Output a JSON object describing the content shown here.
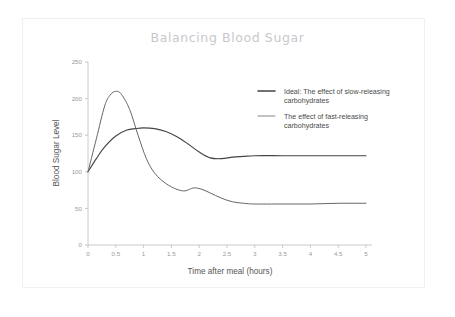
{
  "chart_data": {
    "type": "line",
    "title": "Balancing Blood Sugar",
    "xlabel": "Time after meal (hours)",
    "ylabel": "Blood Sugar Level",
    "xlim": [
      0,
      5
    ],
    "ylim": [
      0,
      250
    ],
    "xticks": [
      "0",
      "0.5",
      "1",
      "1.5",
      "2",
      "2.5",
      "3",
      "3.5",
      "4",
      "4.5",
      "5"
    ],
    "yticks": [
      "0",
      "50",
      "100",
      "150",
      "200",
      "250"
    ],
    "grid": false,
    "legend_position": "upper right",
    "series": [
      {
        "name": "Ideal: The effect of slow-releasing carbohydrates",
        "color": "#444444",
        "width": 1.15,
        "x": [
          0,
          0.15,
          0.3,
          0.5,
          0.7,
          0.85,
          1.0,
          1.2,
          1.4,
          1.6,
          1.8,
          2.0,
          2.2,
          2.4,
          2.6,
          2.8,
          3.0,
          3.5,
          4.0,
          4.5,
          5.0
        ],
        "y": [
          100,
          118,
          134,
          149,
          157,
          159,
          160,
          159,
          155,
          148,
          138,
          127,
          119,
          118,
          120,
          121,
          122,
          122,
          122,
          122,
          122
        ]
      },
      {
        "name": "The effect of fast-releasing carbohydrates",
        "color": "#666666",
        "width": 1.0,
        "x": [
          0,
          0.15,
          0.3,
          0.4,
          0.5,
          0.6,
          0.75,
          0.9,
          1.05,
          1.2,
          1.4,
          1.6,
          1.75,
          1.9,
          2.05,
          2.2,
          2.4,
          2.6,
          2.8,
          3.0,
          3.5,
          4.0,
          4.5,
          5.0
        ],
        "y": [
          100,
          145,
          190,
          205,
          210,
          206,
          185,
          150,
          118,
          98,
          84,
          76,
          74,
          78,
          76,
          71,
          64,
          59,
          57,
          56,
          56,
          56,
          57,
          57
        ]
      }
    ],
    "legend": [
      {
        "line1": "Ideal: The effect of slow-releasing",
        "line2": "carbohydrates",
        "color": "#444444"
      },
      {
        "line1": "The effect of fast-releasing",
        "line2": "carbohydrates",
        "color": "#888888"
      }
    ]
  }
}
